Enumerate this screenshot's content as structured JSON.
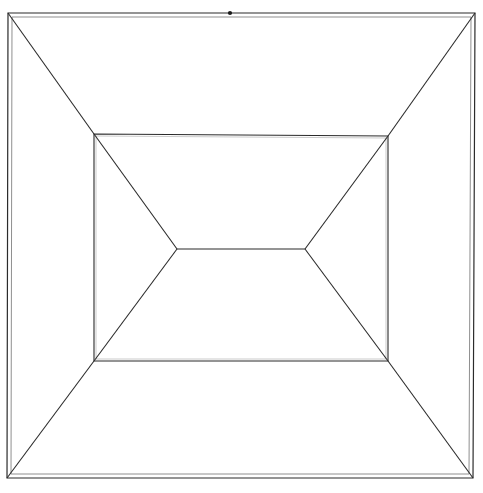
{
  "figure": {
    "canvas": {
      "width": 483,
      "height": 493
    },
    "background_color": "#ffffff",
    "stroke_color": "#2b2b2b",
    "stroke_color_light": "#8f8f8f",
    "stroke_width": 1.1,
    "outer_rectangle": {
      "name": "outer-frame",
      "top_left": [
        8,
        13
      ],
      "top_right": [
        475,
        13
      ],
      "bottom_right": [
        473,
        478
      ],
      "bottom_left": [
        7,
        478
      ],
      "doubled": true,
      "inner_offset": 4
    },
    "middle_rectangle": {
      "name": "middle-frame",
      "top_left": [
        94,
        134
      ],
      "top_right": [
        388,
        136
      ],
      "bottom_right": [
        388,
        361
      ],
      "bottom_left": [
        94,
        361
      ]
    },
    "inner_edge": {
      "name": "inner-vanishing-edge",
      "left_vertex": [
        177,
        249
      ],
      "right_vertex": [
        305,
        249
      ]
    },
    "diagonals": [
      {
        "name": "diagonal-outer-top-left",
        "from": [
          8,
          13
        ],
        "to": [
          94,
          134
        ]
      },
      {
        "name": "diagonal-outer-top-right",
        "from": [
          475,
          13
        ],
        "to": [
          388,
          136
        ]
      },
      {
        "name": "diagonal-outer-bottom-left",
        "from": [
          7,
          478
        ],
        "to": [
          94,
          361
        ]
      },
      {
        "name": "diagonal-outer-bottom-right",
        "from": [
          473,
          478
        ],
        "to": [
          388,
          361
        ]
      },
      {
        "name": "diagonal-inner-top-left",
        "from": [
          94,
          134
        ],
        "to": [
          177,
          249
        ]
      },
      {
        "name": "diagonal-inner-top-right",
        "from": [
          388,
          136
        ],
        "to": [
          305,
          249
        ]
      },
      {
        "name": "diagonal-inner-bottom-left",
        "from": [
          94,
          361
        ],
        "to": [
          177,
          249
        ]
      },
      {
        "name": "diagonal-inner-bottom-right",
        "from": [
          388,
          361
        ],
        "to": [
          305,
          249
        ]
      }
    ],
    "mark_dot": {
      "name": "ink-dot-top-edge",
      "center": [
        230,
        13
      ],
      "radius": 2.1,
      "color": "#1a1a1a"
    }
  }
}
